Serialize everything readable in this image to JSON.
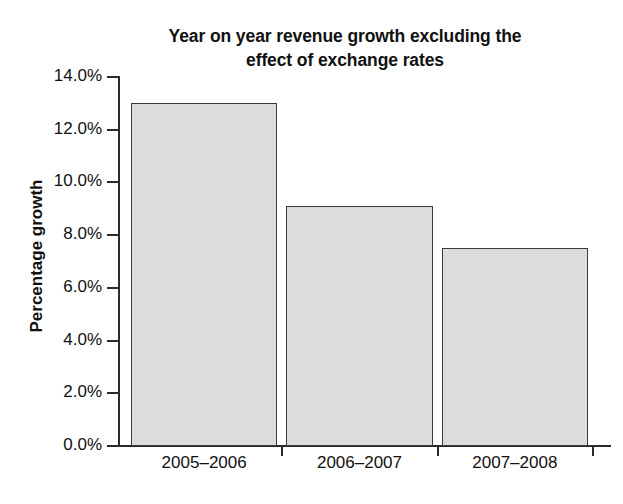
{
  "chart_data": {
    "type": "bar",
    "title": "Year on year revenue growth excluding the effect of exchange rates",
    "title_line1": "Year on year revenue growth excluding the",
    "title_line2": "effect of exchange rates",
    "xlabel": "",
    "ylabel": "Percentage growth",
    "categories": [
      "2005–2006",
      "2006–2007",
      "2007–2008"
    ],
    "values": [
      13.0,
      9.1,
      7.5
    ],
    "value_labels": [
      "13.0%",
      "9.1%",
      "7.5%"
    ],
    "ylim": [
      0.0,
      14.0
    ],
    "ytick_values": [
      0.0,
      2.0,
      4.0,
      6.0,
      8.0,
      10.0,
      12.0,
      14.0
    ],
    "ytick_labels": [
      "0.0%",
      "2.0%",
      "4.0%",
      "6.0%",
      "8.0%",
      "10.0%",
      "12.0%",
      "14.0%"
    ],
    "grid": false,
    "legend": null,
    "legend_position": "none",
    "bar_fill_color": "#dcdcdc",
    "bar_edge_color": "#3a3a3a",
    "axis_color": "#2b2b2b",
    "text_color": "#111111",
    "background_color": "#ffffff"
  }
}
